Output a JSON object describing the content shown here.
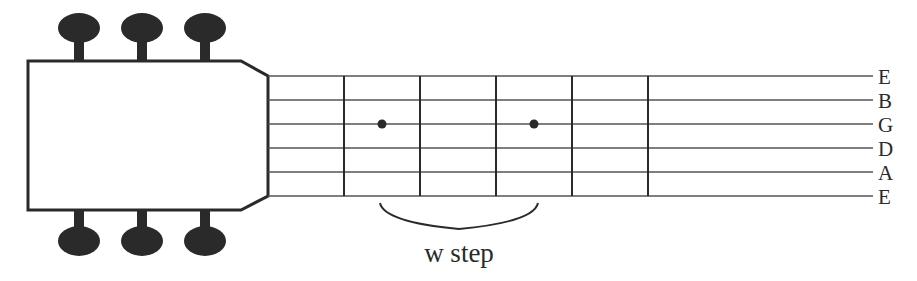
{
  "diagram": {
    "strings": [
      "E",
      "B",
      "G",
      "D",
      "A",
      "E"
    ],
    "fret_count": 5,
    "tuning_pegs": {
      "top": 3,
      "bottom": 3
    },
    "markers": [
      {
        "string": "G",
        "fret_gap": 1
      },
      {
        "string": "G",
        "fret_gap": 3
      }
    ],
    "bracket_label": "w step",
    "colors": {
      "ink": "#2a2a2a",
      "string": "#555555",
      "background": "#ffffff"
    }
  }
}
